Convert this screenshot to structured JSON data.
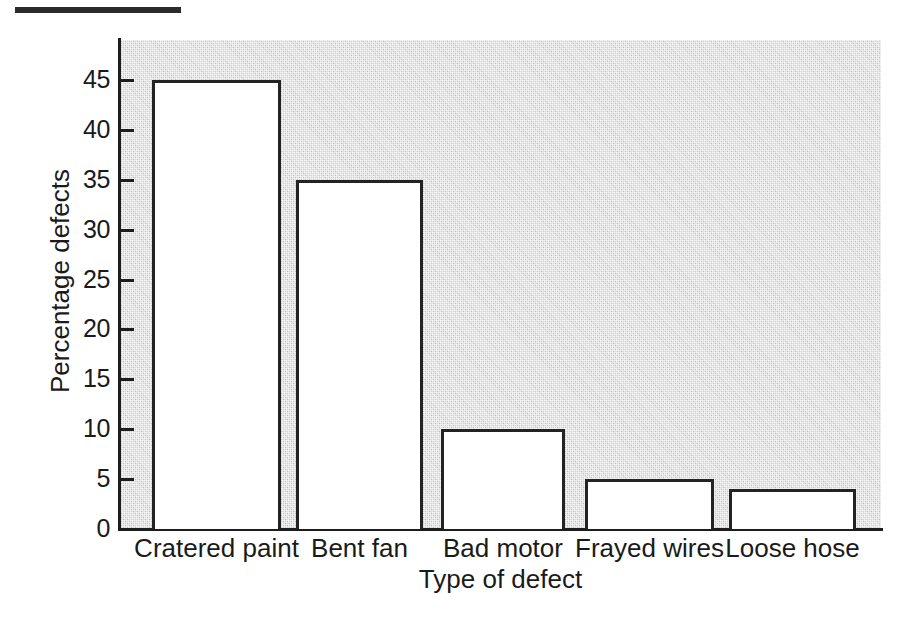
{
  "decor": {
    "top_rule": "solid-black-rule"
  },
  "chart_data": {
    "type": "bar",
    "title": "",
    "subtitle": "",
    "xlabel": "Type of defect",
    "ylabel": "Percentage defects",
    "categories": [
      "Cratered paint",
      "Bent fan",
      "Bad motor",
      "Frayed wires",
      "Loose hose"
    ],
    "values": [
      45,
      35,
      10,
      5,
      4
    ],
    "ylim": [
      0,
      49
    ],
    "yticks": [
      0,
      5,
      10,
      15,
      20,
      25,
      30,
      35,
      40,
      45
    ],
    "ytick_labels": [
      "0",
      "5",
      "10",
      "15",
      "20",
      "25",
      "30",
      "35",
      "40",
      "45"
    ],
    "grid": false,
    "legend": null,
    "legend_position": "none",
    "series": [
      {
        "name": "Percentage defects",
        "values": [
          45,
          35,
          10,
          5,
          4
        ]
      }
    ],
    "style": {
      "bar_fill": "#ffffff",
      "bar_edge": "#232323",
      "plot_background": "#d2d2d2",
      "axis_color": "#1d1d1d",
      "text_color": "#1a1a1a",
      "tick_direction": "in"
    }
  }
}
